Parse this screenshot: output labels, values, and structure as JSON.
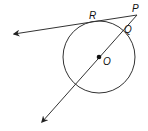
{
  "diagram": {
    "type": "geometry",
    "stroke_color": "#333333",
    "labels": {
      "P": "P",
      "R": "R",
      "Q": "Q",
      "O": "O"
    },
    "circle": {
      "center": "O",
      "cx": 99,
      "cy": 57,
      "r": 36
    },
    "points": {
      "P": {
        "x": 137,
        "y": 15
      },
      "R": {
        "x": 94,
        "y": 21
      },
      "Q": {
        "x": 123,
        "y": 30
      },
      "O": {
        "x": 99,
        "y": 57
      }
    },
    "rays": [
      {
        "name": "tangent-ray-PR",
        "from": "P",
        "through": "R",
        "end": {
          "x": 12,
          "y": 34
        }
      },
      {
        "name": "secant-ray-PO",
        "from": "P",
        "through": "O",
        "end": {
          "x": 41,
          "y": 124
        }
      }
    ]
  }
}
